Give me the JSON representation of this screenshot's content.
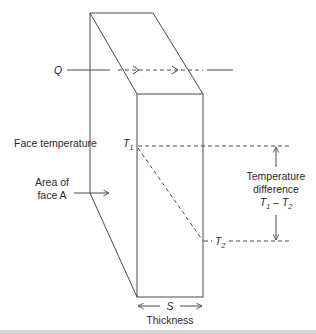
{
  "diagram": {
    "colors": {
      "line": "#4a4a4a",
      "text": "#2a2a2a",
      "background": "#ffffff",
      "bottom_band": "#d6d6d6"
    },
    "labels": {
      "heat_flow": "Q",
      "face_temperature": "Face temperature",
      "t1_main": "T",
      "t1_sub": "1",
      "t2_main": "T",
      "t2_sub": "2",
      "area_line1": "Area of",
      "area_line2": "face A",
      "temp_diff_line1": "Temperature",
      "temp_diff_line2": "difference",
      "temp_diff_t1_main": "T",
      "temp_diff_t1_sub": "1",
      "temp_diff_minus": "–",
      "temp_diff_t2_main": "T",
      "temp_diff_t2_sub": "2",
      "thickness_symbol": "S",
      "thickness": "Thickness"
    }
  }
}
